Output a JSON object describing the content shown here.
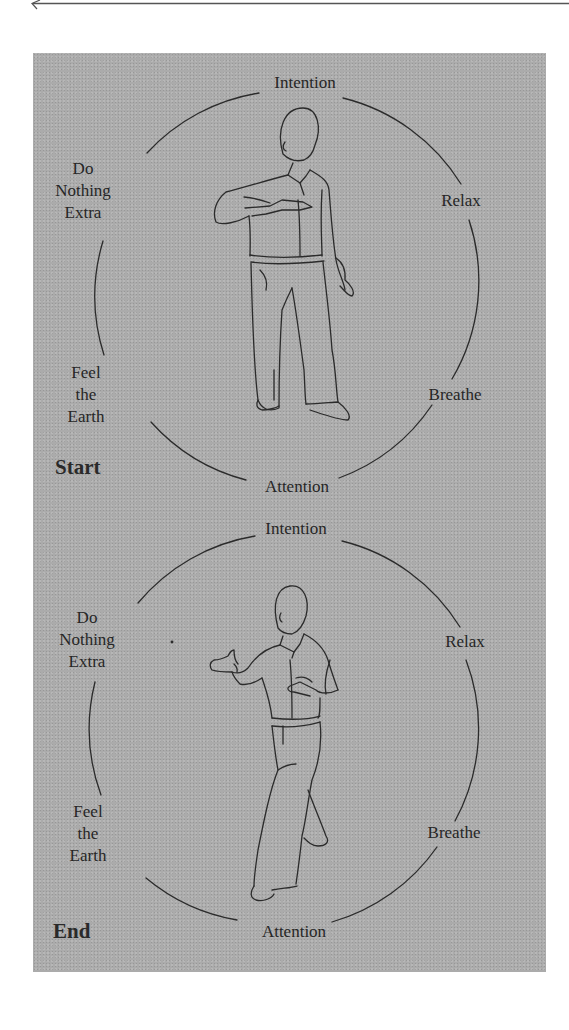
{
  "page": {
    "background": "#ffffff",
    "panel_color": "#ababab",
    "ink_color": "#262626"
  },
  "top_rule": {
    "icon": "left-arrow-icon"
  },
  "diagrams": [
    {
      "phase_label": "Start",
      "principles": {
        "top": "Intention",
        "upper_left": [
          "Do",
          "Nothing",
          "Extra"
        ],
        "upper_right": "Relax",
        "lower_left": [
          "Feel",
          "the",
          "Earth"
        ],
        "lower_right": "Breathe",
        "bottom": "Attention"
      },
      "figure": "standing-figure-start-pose"
    },
    {
      "phase_label": "End",
      "principles": {
        "top": "Intention",
        "upper_left": [
          "Do",
          "Nothing",
          "Extra"
        ],
        "upper_right": "Relax",
        "lower_left": [
          "Feel",
          "the",
          "Earth"
        ],
        "lower_right": "Breathe",
        "bottom": "Attention"
      },
      "figure": "stepping-figure-end-pose"
    }
  ]
}
